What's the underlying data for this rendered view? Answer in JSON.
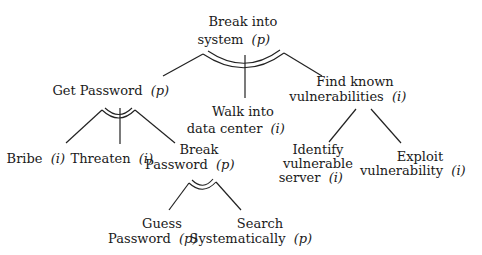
{
  "legend": {
    "p": "p",
    "i": "i"
  },
  "nodes": {
    "root": {
      "lines": [
        "Break into",
        "system"
      ],
      "tag": "(p)",
      "decomposition": "AND"
    },
    "getpw": {
      "lines": [
        "Get Password"
      ],
      "tag": "(p)",
      "decomposition": "AND"
    },
    "walk": {
      "lines": [
        "Walk into",
        "data center"
      ],
      "tag": "(i)"
    },
    "findvuln": {
      "lines": [
        "Find known",
        "vulnerabilities"
      ],
      "tag": "(i)",
      "decomposition": "OR"
    },
    "bribe": {
      "lines": [
        "Bribe"
      ],
      "tag": "(i)"
    },
    "threaten": {
      "lines": [
        "Threaten"
      ],
      "tag": "(i)"
    },
    "breakpw": {
      "lines": [
        "Break",
        "Password"
      ],
      "tag": "(p)",
      "decomposition": "AND"
    },
    "guess": {
      "lines": [
        "Guess",
        "Password"
      ],
      "tag": "(p)"
    },
    "search": {
      "lines": [
        "Search",
        "Systematically"
      ],
      "tag": "(p)"
    },
    "identify": {
      "lines": [
        "Identify",
        "vulnerable",
        "server"
      ],
      "tag": "(i)"
    },
    "exploit": {
      "lines": [
        "Exploit",
        "vulnerability"
      ],
      "tag": "(i)"
    }
  },
  "edges": [
    [
      "root",
      "getpw"
    ],
    [
      "root",
      "walk"
    ],
    [
      "root",
      "findvuln"
    ],
    [
      "getpw",
      "bribe"
    ],
    [
      "getpw",
      "threaten"
    ],
    [
      "getpw",
      "breakpw"
    ],
    [
      "breakpw",
      "guess"
    ],
    [
      "breakpw",
      "search"
    ],
    [
      "findvuln",
      "identify"
    ],
    [
      "findvuln",
      "exploit"
    ]
  ]
}
